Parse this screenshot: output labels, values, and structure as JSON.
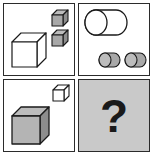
{
  "puzzle": {
    "title": "Visual analogy matrix puzzle",
    "type": "2x2 analogy matrix",
    "question_symbol": "?",
    "panels": [
      {
        "id": "panel-top-left",
        "position": "top-left",
        "background": "#ffffff",
        "description": "One large white cube at lower-left and two small gray cubes stacked vertically at upper-right",
        "shapes": [
          {
            "name": "large-white-cube",
            "solid": "cube",
            "size": "large",
            "fill": "#ffffff",
            "count": 1,
            "x": 7,
            "y": 28,
            "w": 36,
            "h": 36
          },
          {
            "name": "small-gray-cube-upper",
            "solid": "cube",
            "size": "small",
            "fill": "#a8a8a8",
            "count": 1,
            "x": 47,
            "y": 5,
            "w": 18,
            "h": 18
          },
          {
            "name": "small-gray-cube-lower",
            "solid": "cube",
            "size": "small",
            "fill": "#a8a8a8",
            "count": 1,
            "x": 47,
            "y": 25,
            "w": 18,
            "h": 18
          }
        ]
      },
      {
        "id": "panel-top-right",
        "position": "top-right",
        "background": "#ffffff",
        "description": "One large white cylinder at upper-left and two small gray cylinders side by side at lower area",
        "shapes": [
          {
            "name": "large-white-cylinder",
            "solid": "cylinder",
            "size": "large",
            "fill": "#ffffff",
            "count": 1,
            "x": 5,
            "y": 5,
            "w": 42,
            "h": 26
          },
          {
            "name": "small-gray-cylinder-left",
            "solid": "cylinder",
            "size": "small",
            "fill": "#a8a8a8",
            "count": 1,
            "x": 19,
            "y": 48,
            "w": 22,
            "h": 15
          },
          {
            "name": "small-gray-cylinder-right",
            "solid": "cylinder",
            "size": "small",
            "fill": "#a8a8a8",
            "count": 1,
            "x": 45,
            "y": 48,
            "w": 22,
            "h": 15
          }
        ]
      },
      {
        "id": "panel-bottom-left",
        "position": "bottom-left",
        "background": "#ffffff",
        "description": "One large gray cube at lower-left and one small white cube at upper-right",
        "shapes": [
          {
            "name": "large-gray-cube",
            "solid": "cube",
            "size": "large",
            "fill": "#a8a8a8",
            "count": 1,
            "x": 7,
            "y": 26,
            "w": 38,
            "h": 38
          },
          {
            "name": "small-white-cube",
            "solid": "cube",
            "size": "small",
            "fill": "#ffffff",
            "count": 1,
            "x": 48,
            "y": 4,
            "w": 17,
            "h": 17
          }
        ]
      },
      {
        "id": "panel-bottom-right",
        "position": "bottom-right",
        "background": "#c9c9c9",
        "description": "Gray answer panel containing a large question mark",
        "shapes": []
      }
    ],
    "colors": {
      "page_background": "#ffffff",
      "panel_border": "#2b2b2b",
      "panel_white_fill": "#ffffff",
      "panel_gray_fill": "#c9c9c9",
      "shape_outline": "#1a1a1a",
      "shape_white_fill": "#ffffff",
      "shape_gray_fill": "#a8a8a8",
      "shape_gray_shade_dark": "#8d8d8d",
      "shape_gray_shade_top": "#bcbcbc",
      "question_mark_color": "#1a1a1a"
    }
  }
}
